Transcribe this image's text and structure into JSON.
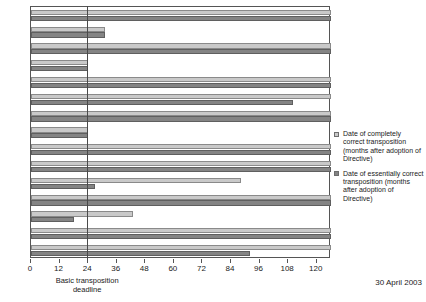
{
  "chart_data": {
    "type": "bar",
    "orientation": "horizontal",
    "title": "",
    "xlabel": "",
    "ylabel": "",
    "xlim": [
      0,
      126
    ],
    "ylim": null,
    "grid": false,
    "xticks": [
      0,
      12,
      24,
      36,
      48,
      60,
      72,
      84,
      96,
      108,
      120
    ],
    "categories": [
      "A",
      "B",
      "D",
      "DK",
      "E",
      "F",
      "FIN",
      "GB",
      "GR",
      "I",
      "IRL",
      "LUX",
      "NL",
      "P",
      "S"
    ],
    "series": [
      {
        "name": "Date of completely correct transposition (months after adoption of Directive)",
        "color": "#c9c9c9",
        "values": [
          126,
          31,
          126,
          24,
          126,
          126,
          126,
          24,
          126,
          126,
          88,
          126,
          43,
          126,
          126
        ]
      },
      {
        "name": "Date of essentially correct transposition (months after adoption of Directive)",
        "color": "#848484",
        "values": [
          126,
          31,
          126,
          24,
          126,
          110,
          126,
          24,
          126,
          126,
          27,
          126,
          18,
          126,
          92
        ]
      }
    ],
    "annotations": [
      {
        "name": "deadline-line",
        "x": 24,
        "label": "Basic transposition deadline"
      },
      {
        "name": "date-annotation",
        "label": "30 April 2003"
      }
    ],
    "legend_position": "right"
  },
  "axis": {
    "tick_labels": [
      "0",
      "12",
      "24",
      "36",
      "48",
      "60",
      "72",
      "84",
      "96",
      "108",
      "120"
    ],
    "category_labels": [
      "A",
      "B",
      "D",
      "DK",
      "E",
      "F",
      "FIN",
      "GB",
      "GR",
      "I",
      "IRL",
      "LUX",
      "NL",
      "P",
      "S"
    ]
  },
  "deadline": {
    "caption_line1": "Basic transposition",
    "caption_line2": "deadline",
    "value": 24
  },
  "footer": {
    "date_annotation": "30 April 2003"
  },
  "legend": {
    "items": [
      {
        "label": "Date of completely correct transposition (months after adoption of Directive)",
        "color": "#c9c9c9"
      },
      {
        "label": "Date of essentially correct transposition (months after adoption of Directive)",
        "color": "#848484"
      }
    ]
  },
  "colors": {
    "light_bar": "#c9c9c9",
    "dark_bar": "#848484",
    "frame": "#555555",
    "deadline_line": "#4a4a4a",
    "background": "#ffffff"
  }
}
